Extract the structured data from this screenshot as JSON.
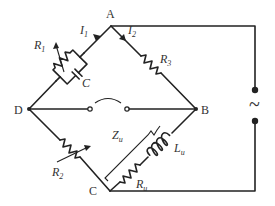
{
  "diagram": {
    "nodes": {
      "A": {
        "label": "A",
        "x": 111,
        "y": 26
      },
      "B": {
        "label": "B",
        "x": 196,
        "y": 109
      },
      "C": {
        "label": "C",
        "x": 110,
        "y": 191
      },
      "D": {
        "label": "D",
        "x": 29,
        "y": 109
      }
    },
    "components": {
      "R1": {
        "symbol": "R",
        "sub": "1",
        "type": "variable resistor",
        "branch": "A-D",
        "parallel_with": "C"
      },
      "C": {
        "symbol": "C",
        "type": "capacitor",
        "branch": "A-D"
      },
      "R2": {
        "symbol": "R",
        "sub": "2",
        "type": "variable resistor",
        "branch": "D-C"
      },
      "R3": {
        "symbol": "R",
        "sub": "3",
        "type": "resistor",
        "branch": "A-B"
      },
      "Lu": {
        "symbol": "L",
        "sub": "u",
        "type": "inductor",
        "branch": "B-C"
      },
      "Ru": {
        "symbol": "R",
        "sub": "u",
        "type": "resistor",
        "branch": "B-C"
      },
      "Zu": {
        "symbol": "Z",
        "sub": "u",
        "type": "unknown impedance bracket",
        "branch": "B-C"
      },
      "detector": {
        "type": "null detector / headphone",
        "branch": "D-B"
      },
      "source": {
        "symbol": "~",
        "type": "AC source",
        "branch": "A-C"
      }
    },
    "currents": {
      "I1": {
        "symbol": "I",
        "sub": "1",
        "branch": "A-D"
      },
      "I2": {
        "symbol": "I",
        "sub": "2",
        "branch": "A-B"
      }
    },
    "labels": {
      "A": "A",
      "B": "B",
      "C": "C",
      "D": "D",
      "I": "I",
      "sub_1": "1",
      "sub_2": "2",
      "sub_3": "3",
      "sub_u": "u",
      "R": "R",
      "Cap": "C",
      "L": "L",
      "Z": "Z",
      "source": "~"
    },
    "colors": {
      "line": "#222222",
      "text": "#333333",
      "background": "#ffffff"
    }
  }
}
